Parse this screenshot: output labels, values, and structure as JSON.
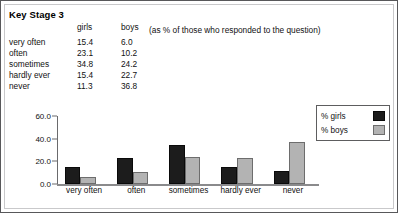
{
  "page": {
    "heading": "Key Stage 3",
    "annotation": "(as % of those who responded to the question)"
  },
  "table": {
    "headers": {
      "category": "",
      "girls": "girls",
      "boys": "boys"
    },
    "rows": [
      {
        "label": "very often",
        "girls": "15.4",
        "boys": "6.0"
      },
      {
        "label": "often",
        "girls": "23.1",
        "boys": "10.2"
      },
      {
        "label": "sometimes",
        "girls": "34.8",
        "boys": "24.2"
      },
      {
        "label": "hardly ever",
        "girls": "15.4",
        "boys": "22.7"
      },
      {
        "label": "never",
        "girls": "11.3",
        "boys": "36.8"
      }
    ]
  },
  "chart_data": {
    "type": "bar",
    "title": "",
    "xlabel": "",
    "ylabel": "",
    "categories": [
      "very often",
      "often",
      "sometimes",
      "hardly ever",
      "never"
    ],
    "series": [
      {
        "name": "% girls",
        "values": [
          15.4,
          23.1,
          34.8,
          15.4,
          11.3
        ],
        "color": "#1c1c1c"
      },
      {
        "name": "% boys",
        "values": [
          6.0,
          10.2,
          24.2,
          22.7,
          36.8
        ],
        "color": "#b3b3b3"
      }
    ],
    "ylim": [
      0.0,
      60.0
    ],
    "yticks": [
      "0.0",
      "20.0",
      "40.0",
      "60.0"
    ],
    "ytick_values": [
      0.0,
      20.0,
      40.0,
      60.0
    ],
    "grid": false,
    "legend_position": "top-right",
    "legend": [
      {
        "label": "% girls",
        "swatch": "girls"
      },
      {
        "label": "% boys",
        "swatch": "boys"
      }
    ]
  }
}
